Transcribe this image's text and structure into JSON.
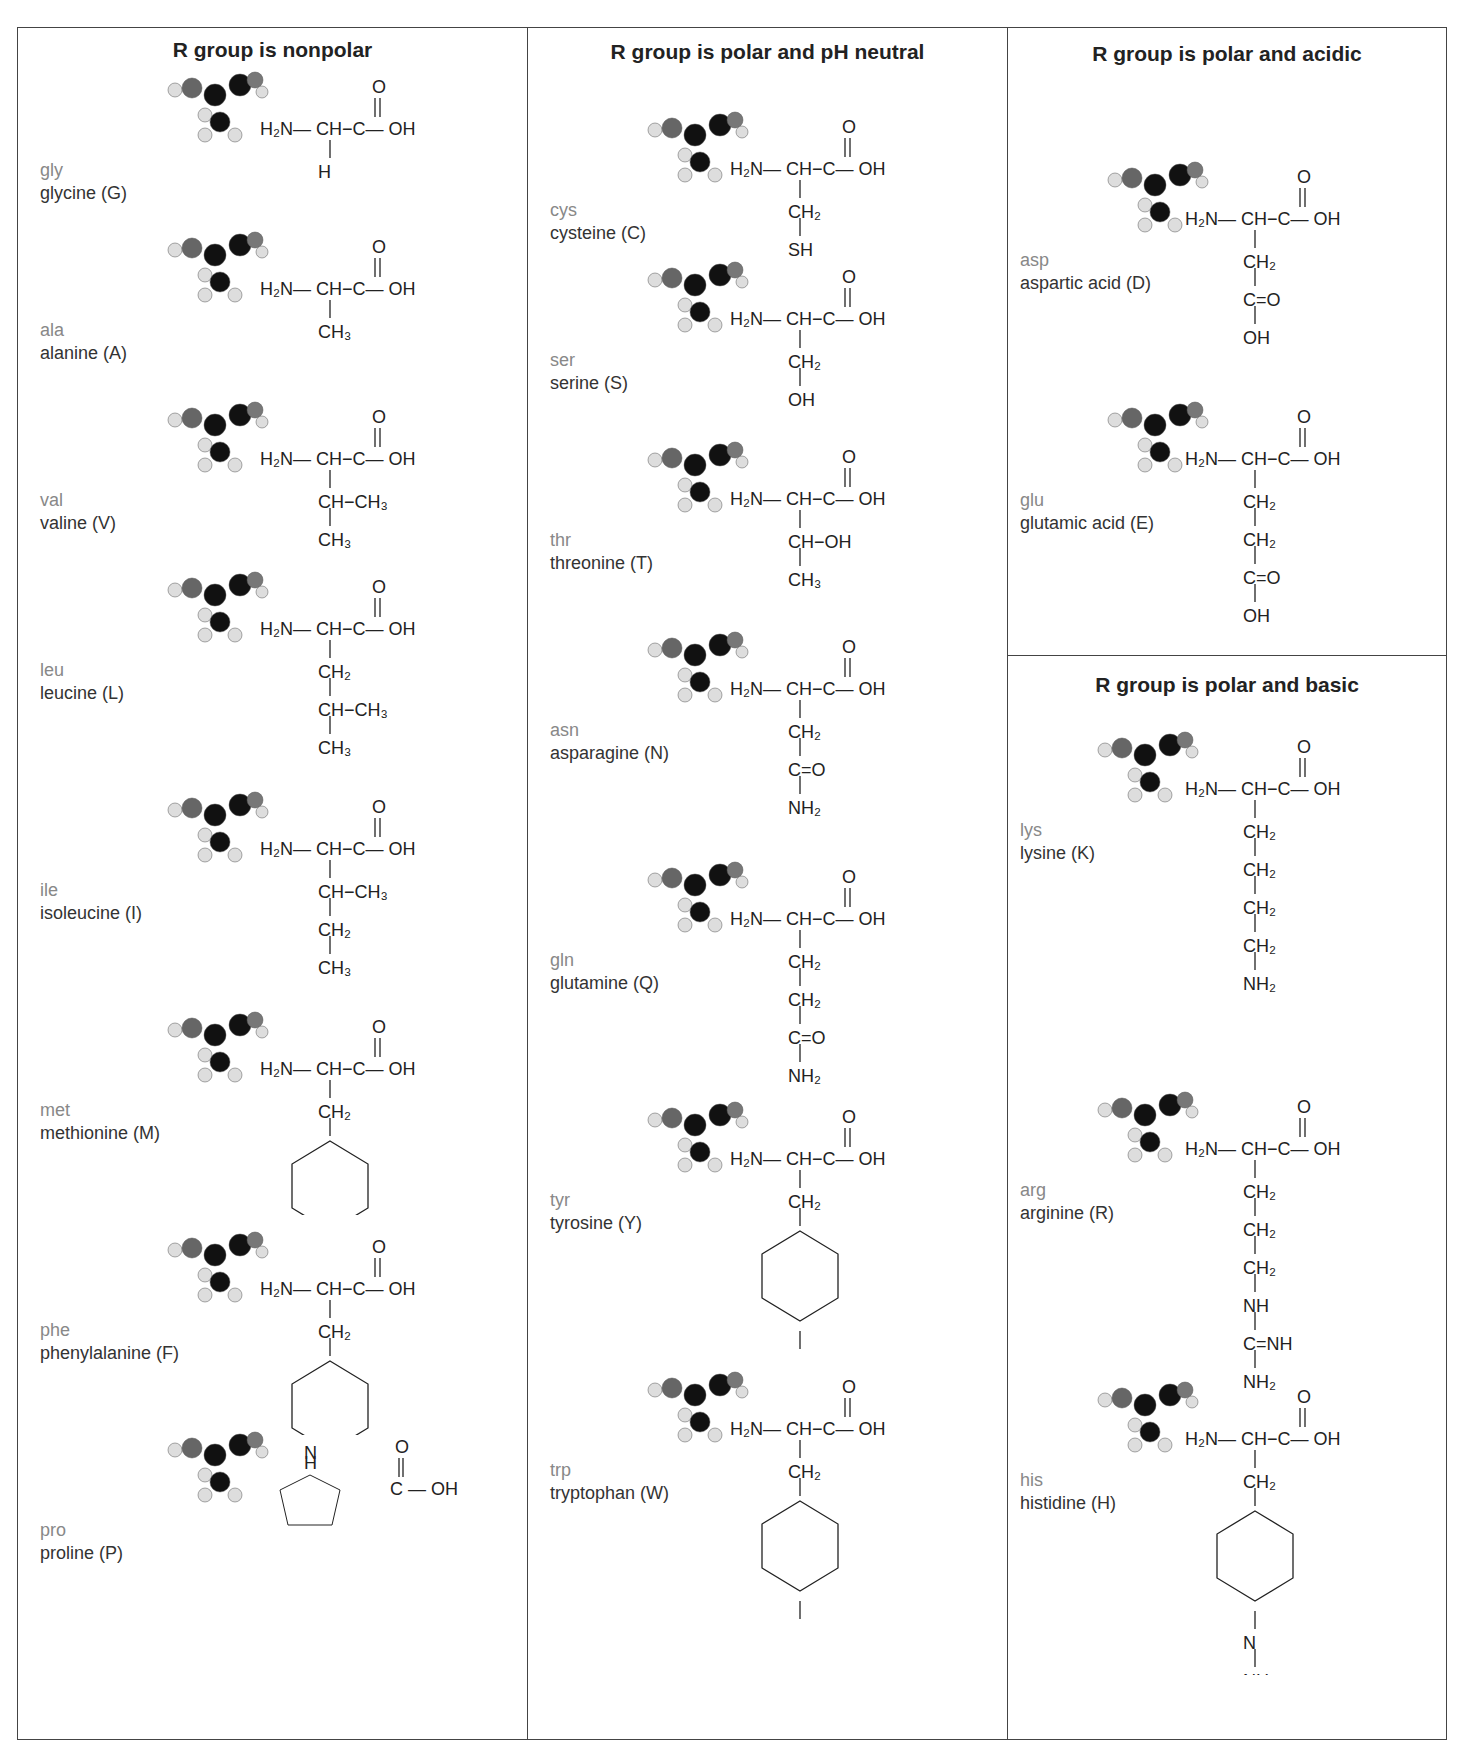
{
  "headers": {
    "nonpolar": "R group is nonpolar",
    "neutral": "R group is polar and pH neutral",
    "acidic": "R group is polar and acidic",
    "basic": "R group is polar and basic"
  },
  "backbone": {
    "amine": "H₂N",
    "alpha": "CH",
    "carboxyl_c": "C",
    "hydroxyl": "OH",
    "carbonyl_o": "O"
  },
  "nonpolar": [
    {
      "abbr": "gly",
      "name": "glycine (G)",
      "r": [
        "H"
      ]
    },
    {
      "abbr": "ala",
      "name": "alanine (A)",
      "r": [
        "CH₃"
      ]
    },
    {
      "abbr": "val",
      "name": "valine (V)",
      "r": [
        "CH−CH₃",
        "CH₃"
      ]
    },
    {
      "abbr": "leu",
      "name": "leucine (L)",
      "r": [
        "CH₂",
        "CH−CH₃",
        "CH₃"
      ]
    },
    {
      "abbr": "ile",
      "name": "isoleucine (I)",
      "r": [
        "CH−CH₃",
        "CH₂",
        "CH₃"
      ]
    },
    {
      "abbr": "met",
      "name": "methionine (M)",
      "r": [
        "CH₂",
        "benzene-ring"
      ]
    },
    {
      "abbr": "phe",
      "name": "phenylalanine (F)",
      "r": [
        "CH₂",
        "benzene-ring"
      ]
    },
    {
      "abbr": "pro",
      "name": "proline (P)",
      "r": [
        "pyrrolidine-ring"
      ]
    }
  ],
  "neutral": [
    {
      "abbr": "cys",
      "name": "cysteine (C)",
      "r": [
        "CH₂",
        "SH"
      ]
    },
    {
      "abbr": "ser",
      "name": "serine (S)",
      "r": [
        "CH₂",
        "OH"
      ]
    },
    {
      "abbr": "thr",
      "name": "threonine (T)",
      "r": [
        "CH−OH",
        "CH₃"
      ]
    },
    {
      "abbr": "asn",
      "name": "asparagine (N)",
      "r": [
        "CH₂",
        "C=O",
        "NH₂"
      ]
    },
    {
      "abbr": "gln",
      "name": "glutamine (Q)",
      "r": [
        "CH₂",
        "CH₂",
        "C=O",
        "NH₂"
      ]
    },
    {
      "abbr": "tyr",
      "name": "tyrosine (Y)",
      "r": [
        "CH₂",
        "phenol-ring",
        "OH"
      ]
    },
    {
      "abbr": "trp",
      "name": "tryptophan (W)",
      "r": [
        "CH₂",
        "indole-ring",
        "NH"
      ]
    }
  ],
  "acidic": [
    {
      "abbr": "asp",
      "name": "aspartic acid (D)",
      "r": [
        "CH₂",
        "C=O",
        "OH"
      ]
    },
    {
      "abbr": "glu",
      "name": "glutamic acid (E)",
      "r": [
        "CH₂",
        "CH₂",
        "C=O",
        "OH"
      ]
    }
  ],
  "basic": [
    {
      "abbr": "lys",
      "name": "lysine (K)",
      "r": [
        "CH₂",
        "CH₂",
        "CH₂",
        "CH₂",
        "NH₂"
      ]
    },
    {
      "abbr": "arg",
      "name": "arginine (R)",
      "r": [
        "CH₂",
        "CH₂",
        "CH₂",
        "NH",
        "C=NH",
        "NH₂"
      ]
    },
    {
      "abbr": "his",
      "name": "histidine (H)",
      "r": [
        "CH₂",
        "imidazole-ring",
        "N",
        "NH"
      ]
    }
  ]
}
